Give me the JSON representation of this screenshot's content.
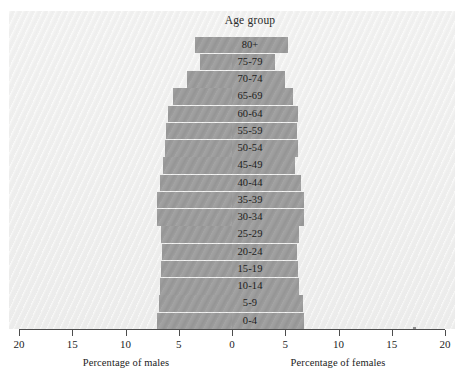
{
  "chart_data": {
    "type": "bar",
    "subtype": "population-pyramid",
    "title": "Age group",
    "xlabel_left": "Percentage of males",
    "xlabel_right": "Percentage of females",
    "ylabel": "Age group",
    "grid": false,
    "legend": "none",
    "xlim": [
      -20,
      20
    ],
    "xticks": [
      20,
      15,
      10,
      5,
      0,
      5,
      10,
      15,
      20
    ],
    "xtick_labels": [
      "20",
      "15",
      "10",
      "5",
      "0",
      "5",
      "10",
      "15",
      "20"
    ],
    "categories": [
      "80+",
      "75-79",
      "70-74",
      "65-69",
      "60-64",
      "55-59",
      "50-54",
      "45-49",
      "40-44",
      "35-39",
      "30-34",
      "25-29",
      "20-24",
      "15-19",
      "10-14",
      "5-9",
      "0-4"
    ],
    "series": [
      {
        "name": "Percentage of males",
        "direction": "left",
        "values": [
          3.5,
          3.0,
          4.2,
          5.5,
          6.0,
          6.2,
          6.3,
          6.5,
          6.8,
          7.0,
          7.0,
          6.7,
          6.6,
          6.7,
          6.8,
          6.9,
          7.0
        ]
      },
      {
        "name": "Percentage of females",
        "direction": "right",
        "values": [
          5.3,
          4.0,
          5.0,
          5.7,
          6.2,
          6.1,
          6.2,
          5.9,
          6.5,
          6.8,
          6.8,
          6.3,
          6.1,
          6.2,
          6.3,
          6.7,
          6.8
        ]
      }
    ],
    "colors": {
      "bar": "#9d9d9d",
      "panel": "#efefee",
      "axis": "#4d4d4d",
      "text": "#1c1c1c"
    }
  }
}
